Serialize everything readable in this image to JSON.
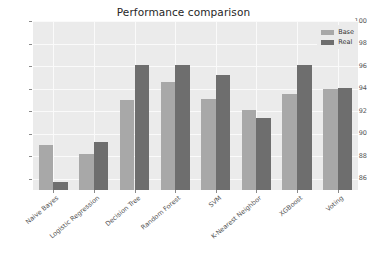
{
  "chart_data": {
    "type": "bar",
    "title": "Performance comparison",
    "xlabel": "",
    "ylabel": "",
    "ylim": [
      85,
      100
    ],
    "yticks": [
      86,
      88,
      90,
      92,
      94,
      96,
      98,
      100
    ],
    "grid": true,
    "legend_position": "upper right",
    "categories": [
      "Naive Bayes",
      "Logistic Regression",
      "Decision Tree",
      "Random Forest",
      "SVM",
      "K-Nearest Neighbor",
      "XGBoost",
      "Voting"
    ],
    "series": [
      {
        "name": "Base",
        "color": "#a8a8a8",
        "values": [
          89.0,
          88.2,
          93.0,
          94.6,
          93.1,
          92.1,
          93.5,
          94.0
        ]
      },
      {
        "name": "Real",
        "color": "#6e6e6e",
        "values": [
          85.7,
          89.3,
          96.1,
          96.1,
          95.2,
          91.4,
          96.1,
          94.1
        ]
      }
    ]
  },
  "figure": {
    "background_color": "#ffffff",
    "plot_background_color": "#ebebeb",
    "gridline_color": "#fafafa",
    "tick_color": "#555555"
  }
}
